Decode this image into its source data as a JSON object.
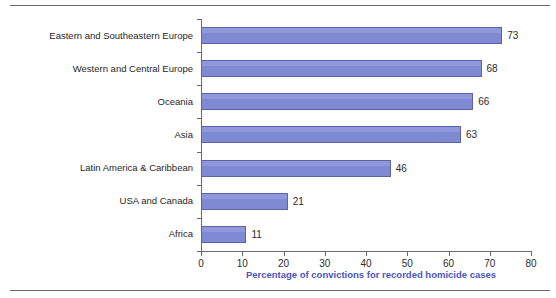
{
  "chart_data": {
    "type": "bar",
    "orientation": "horizontal",
    "title": "",
    "subtitle": "",
    "xlabel": "Percentage of convictions for recorded homicide cases",
    "ylabel": "",
    "xlim": [
      0,
      80
    ],
    "xticks": [
      0,
      10,
      20,
      30,
      40,
      50,
      60,
      70,
      80
    ],
    "xtick_labels": [
      "0",
      "10",
      "20",
      "30",
      "40",
      "50",
      "60",
      "70",
      "80"
    ],
    "grid": false,
    "legend": null,
    "categories": [
      "Eastern and Southeastern Europe",
      "Western and Central Europe",
      "Oceania",
      "Asia",
      "Latin America & Caribbean",
      "USA and Canada",
      "Africa"
    ],
    "values": [
      73,
      68,
      66,
      63,
      46,
      21,
      11
    ],
    "value_labels": [
      "73",
      "68",
      "66",
      "63",
      "46",
      "21",
      "11"
    ],
    "series": [
      {
        "name": "Percentage of convictions for recorded homicide cases",
        "values": [
          73,
          68,
          66,
          63,
          46,
          21,
          11
        ]
      }
    ],
    "colors": {
      "bar_fill": "#7f8ad3",
      "bar_highlight": "#8e98db",
      "bar_stroke": "#5a63a8",
      "axis": "#6b6b6b",
      "axis_title": "#4a56bb",
      "tick_text": "#2b2b2b",
      "category_text": "#1f1f1f",
      "rule": "#6e6e6e",
      "background": "#ffffff"
    }
  }
}
